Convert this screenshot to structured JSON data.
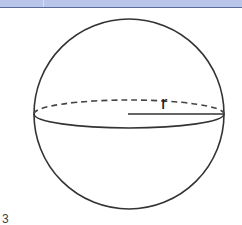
{
  "header": {
    "bar_color": "#b9c6ea",
    "border_color": "#5a6a9a"
  },
  "diagram": {
    "shape": "sphere",
    "radius_label": "r",
    "stroke_color": "#333333",
    "center": [
      129,
      114
    ],
    "radius_px": 95,
    "equator_ry": 12
  },
  "footer": {
    "fragment": "3"
  }
}
